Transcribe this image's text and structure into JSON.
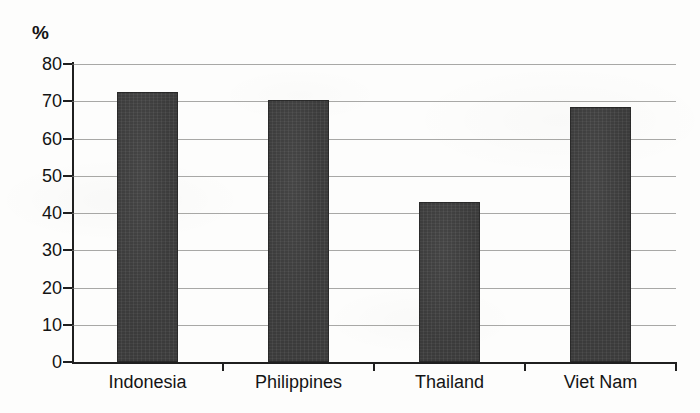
{
  "chart_data": {
    "type": "bar",
    "title": "",
    "subtitle": "",
    "xlabel": "",
    "ylabel": "%",
    "unit_label": "%",
    "categories": [
      "Indonesia",
      "Philippines",
      "Thailand",
      "Viet Nam"
    ],
    "values": [
      72.5,
      70.3,
      43.0,
      68.5
    ],
    "series": [
      {
        "name": "",
        "values": [
          72.5,
          70.3,
          43.0,
          68.5
        ]
      }
    ],
    "ylim": [
      0,
      80
    ],
    "ytick_step": 10,
    "yticks": [
      "80",
      "70",
      "60",
      "50",
      "40",
      "30",
      "20",
      "10",
      "0"
    ],
    "ytick_values": [
      80,
      70,
      60,
      50,
      40,
      30,
      20,
      10,
      0
    ],
    "grid": true,
    "grid_axis": "y",
    "legend": false,
    "legend_position": "none",
    "annotations": [],
    "bar_color": "#3b3b3b",
    "gridline_color": "#7b7b78",
    "axis_color": "#1f1f1f",
    "background_color": "#fdfdfc"
  }
}
